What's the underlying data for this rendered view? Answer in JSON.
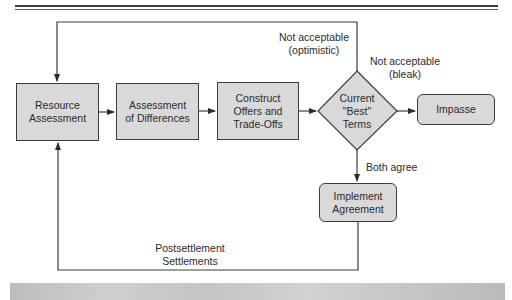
{
  "diagram": {
    "type": "flowchart",
    "nodes": {
      "resource_assessment": "Resource\nAssessment",
      "assessment_of_differences": "Assessment\nof Differences",
      "construct_offers": "Construct\nOffers and\nTrade-Offs",
      "current_best_terms": "Current\n\"Best\"\nTerms",
      "impasse": "Impasse",
      "implement_agreement": "Implement\nAgreement"
    },
    "edge_labels": {
      "not_acceptable_optimistic": "Not acceptable\n(optimistic)",
      "not_acceptable_bleak": "Not acceptable\n(bleak)",
      "both_agree": "Both agree",
      "postsettlement": "Postsettlement\nSettlements"
    },
    "edges": [
      {
        "from": "Resource Assessment",
        "to": "Assessment of Differences"
      },
      {
        "from": "Assessment of Differences",
        "to": "Construct Offers and Trade-Offs"
      },
      {
        "from": "Construct Offers and Trade-Offs",
        "to": "Current \"Best\" Terms"
      },
      {
        "from": "Current \"Best\" Terms",
        "to": "Impasse",
        "label": "Not acceptable (bleak)"
      },
      {
        "from": "Current \"Best\" Terms",
        "to": "Resource Assessment",
        "label": "Not acceptable (optimistic)"
      },
      {
        "from": "Current \"Best\" Terms",
        "to": "Implement Agreement",
        "label": "Both agree"
      },
      {
        "from": "Implement Agreement",
        "to": "Resource Assessment",
        "label": "Postsettlement Settlements"
      }
    ],
    "colors": {
      "box_fill": "#d9d9d9",
      "stroke": "#3c3c3c",
      "band": "#c6c6c6"
    }
  }
}
